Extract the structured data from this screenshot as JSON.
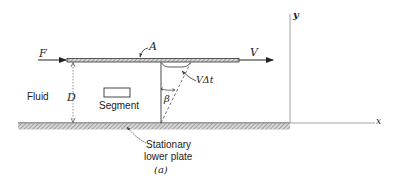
{
  "figure": {
    "caption": "(a)",
    "labels": {
      "force": "F",
      "area": "A",
      "velocity": "V",
      "displacement": "VΔt",
      "angle": "β",
      "gap": "D",
      "fluid": "Fluid",
      "segment": "Segment",
      "lower_plate_line1": "Stationary",
      "lower_plate_line2": "lower plate",
      "y_axis": "y",
      "x_axis": "x"
    },
    "colors": {
      "line": "#333333",
      "hatch": "#888888",
      "axis": "#999999",
      "background": "#ffffff"
    }
  }
}
